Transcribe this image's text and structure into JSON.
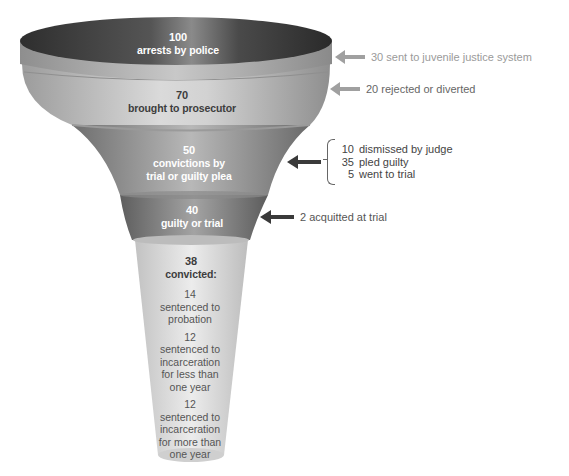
{
  "colors": {
    "stage1_top": "#3a3a3a",
    "stage1_rim": "#9a9a9a",
    "stage2": "#b8b8b8",
    "stage3": "#8c8c8c",
    "stage4": "#7a7a7a",
    "stage5": "#d6d6d6",
    "arrow_light": "#9e9e9e",
    "arrow_dark": "#3a3a3a",
    "text_light_annotation": "#9a9a9a",
    "text_dark_annotation": "#555555"
  },
  "funnel": {
    "stages": [
      {
        "value": "100",
        "label": "arrests by police"
      },
      {
        "value": "70",
        "label": "brought to prosecutor"
      },
      {
        "value": "50",
        "label_line1": "convictions by",
        "label_line2": "trial or guilty plea"
      },
      {
        "value": "40",
        "label": "guilty or trial"
      },
      {
        "value": "38",
        "label": "convicted:"
      }
    ],
    "outcomes": [
      {
        "value": "14",
        "lines": [
          "sentenced to",
          "probation"
        ]
      },
      {
        "value": "12",
        "lines": [
          "sentenced to",
          "incarceration",
          "for less than",
          "one year"
        ]
      },
      {
        "value": "12",
        "lines": [
          "sentenced to",
          "incarceration",
          "for more than",
          "one year"
        ]
      }
    ]
  },
  "annotations": {
    "juvenile": "30 sent to juvenile justice system",
    "rejected": "20 rejected or diverted",
    "breakdown": [
      {
        "num": "10",
        "text": "dismissed by judge"
      },
      {
        "num": "35",
        "text": "pled guilty"
      },
      {
        "num": "5",
        "text": "went to trial"
      }
    ],
    "acquitted": "2 acquitted at trial"
  }
}
